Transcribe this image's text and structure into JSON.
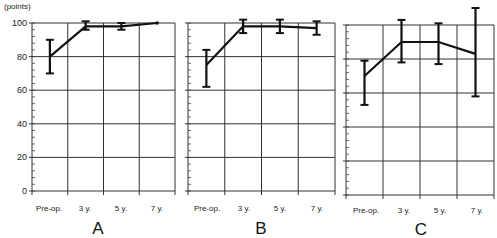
{
  "chart_data": [
    {
      "type": "line",
      "panel": "A",
      "ylabel": "(points)",
      "ylim": [
        0,
        100
      ],
      "yticks": [
        0,
        20,
        40,
        60,
        80,
        100
      ],
      "categories": [
        "Pre-op.",
        "3 y.",
        "5 y.",
        "7 y."
      ],
      "series": [
        {
          "name": "A",
          "values": [
            80,
            98,
            98,
            100
          ],
          "err_low": [
            70,
            96,
            96,
            100
          ],
          "err_high": [
            90,
            101,
            100,
            100
          ]
        }
      ],
      "grid": true
    },
    {
      "type": "line",
      "panel": "B",
      "ylim": [
        0,
        100
      ],
      "yticks": [
        0,
        20,
        40,
        60,
        80,
        100
      ],
      "categories": [
        "Pre-op.",
        "3 y.",
        "5 y.",
        "7 y."
      ],
      "series": [
        {
          "name": "B",
          "values": [
            75,
            98,
            98,
            97
          ],
          "err_low": [
            62,
            94,
            94,
            93
          ],
          "err_high": [
            84,
            102,
            102,
            101
          ]
        }
      ],
      "grid": true
    },
    {
      "type": "line",
      "panel": "C",
      "ylim": [
        0,
        100
      ],
      "yticks": [
        0,
        20,
        40,
        60,
        80,
        100
      ],
      "categories": [
        "Pre-op.",
        "3 y.",
        "5 y.",
        "7 y."
      ],
      "series": [
        {
          "name": "C",
          "values": [
            70,
            90,
            90,
            83
          ],
          "err_low": [
            53,
            78,
            77,
            58
          ],
          "err_high": [
            79,
            103,
            101,
            110
          ]
        }
      ],
      "grid": true
    }
  ],
  "labels": {
    "unit": "(points)",
    "yticks": [
      "100",
      "80",
      "60",
      "40",
      "20",
      "0"
    ],
    "xticks": [
      "Pre-op.",
      "3 y.",
      "5 y.",
      "7 y."
    ],
    "panels": [
      "A",
      "B",
      "C"
    ]
  }
}
